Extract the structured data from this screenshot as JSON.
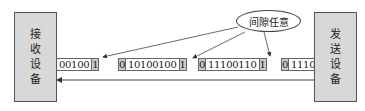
{
  "receiver": {
    "label": [
      "接",
      "收",
      "设",
      "备"
    ]
  },
  "sender": {
    "label": [
      "发",
      "送",
      "设",
      "备"
    ]
  },
  "callout": {
    "text": "间隙任意"
  },
  "frames": [
    {
      "start_bit": "",
      "data": "00100",
      "stop_bit": "1"
    },
    {
      "start_bit": "0",
      "data": "10100100",
      "stop_bit": "1"
    },
    {
      "start_bit": "0",
      "data": "11100110",
      "stop_bit": "1"
    },
    {
      "start_bit": "0",
      "data": "1110",
      "stop_bit": ""
    }
  ],
  "colors": {
    "device_fill": "#d8d8d8",
    "bit_fill": "#c8c8c8",
    "line": "#444444"
  }
}
